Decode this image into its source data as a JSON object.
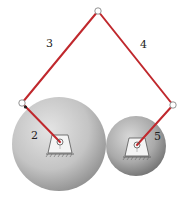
{
  "diagram": {
    "link_color": "#c0282d",
    "labels": {
      "link2": "2",
      "link3": "3",
      "link4": "4",
      "link5": "5"
    },
    "gears": [
      {
        "name": "large-gear",
        "cx": 59,
        "cy": 144,
        "r": 47
      },
      {
        "name": "small-gear",
        "cx": 136,
        "cy": 146,
        "r": 30
      }
    ],
    "joints": {
      "top": {
        "x": 98,
        "y": 11
      },
      "left": {
        "x": 22,
        "y": 103
      },
      "right": {
        "x": 173,
        "y": 105
      },
      "ground_left": {
        "x": 60,
        "y": 142
      },
      "ground_right": {
        "x": 137,
        "y": 145
      }
    }
  }
}
